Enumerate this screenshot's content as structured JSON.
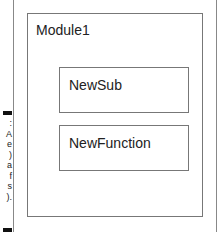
{
  "diagram": {
    "module": {
      "title": "Module1"
    },
    "procedures": [
      {
        "label": "NewSub"
      },
      {
        "label": "NewFunction"
      }
    ]
  },
  "margin_caption": {
    "fragments": [
      ":",
      "A",
      "e",
      ")",
      "a",
      "f",
      "s",
      ")."
    ]
  },
  "colors": {
    "border": "#777777",
    "text": "#222222",
    "background": "#ffffff"
  }
}
